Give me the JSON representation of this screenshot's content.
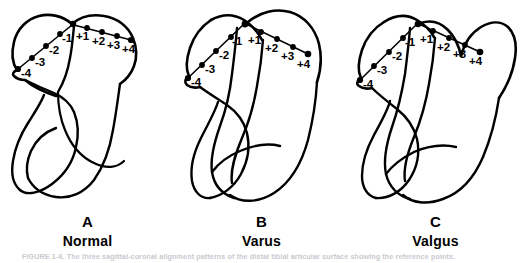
{
  "figure": {
    "background_color": "#ffffff",
    "ink_color": "#000000",
    "caption_line": "FIGURE 1-6.  The three sagittal-coronal alignment patterns of the distal tibial articular surface showing the reference points.",
    "panels": [
      {
        "id": "A",
        "letter": "A",
        "title": "Normal",
        "negative_labels": [
          "-4",
          "-3",
          "-2",
          "-1"
        ],
        "positive_labels": [
          "+1",
          "+2",
          "+3",
          "+4"
        ]
      },
      {
        "id": "B",
        "letter": "B",
        "title": "Varus",
        "negative_labels": [
          "-4",
          "-3",
          "-2",
          "-1"
        ],
        "positive_labels": [
          "+1",
          "+2",
          "+3",
          "+4"
        ]
      },
      {
        "id": "C",
        "letter": "C",
        "title": "Valgus",
        "negative_labels": [
          "-4",
          "-3",
          "-2",
          "-1"
        ],
        "positive_labels": [
          "+1",
          "+2",
          "+3",
          "+4"
        ]
      }
    ]
  }
}
